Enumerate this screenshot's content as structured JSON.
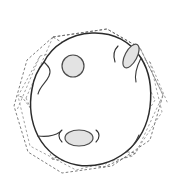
{
  "figure": {
    "background_color": "#ffffff",
    "width": 179,
    "height": 182
  },
  "style": {
    "cage_stroke": "#6e6e6e",
    "cage_dash": "2.6 2.1",
    "membrane_stroke": "#2b2b2b",
    "pore_fill": "#e3e3e3",
    "pore_stroke": "#4a4a4a"
  },
  "cage": {
    "name": "dodecahedral-wireframe",
    "line_style": "dashed",
    "top_face": "M 53 37 L 107 29 L 140 48 L 86 57 Z",
    "top_face_inner": "M 58 47 L 106 40 L 133 55 L 86 63 Z",
    "left_verticals": "M 53 37 L 26 98 M 58 47 L 33 101 M 40 56 L 17 110",
    "outer_hull": "M 53 37 L 107 29 L 140 48 L 163 95 L 150 140 L 112 166 L 62 173 L 28 152 L 14 106 L 27 60 Z",
    "second_hull": "M 40 56 L 99 41 L 150 62 L 162 112 L 133 156 L 76 170 L 30 146 L 18 96 Z",
    "bottom_face": "M 47 145 L 98 153 L 130 141 L 79 133 Z",
    "bottom_face_lower": "M 52 159 L 104 167 L 136 153 L 84 146 Z",
    "right_struts": "M 140 48 L 163 95 M 133 55 L 155 100 M 150 62 L 168 104",
    "bottom_struts": "M 26 98 L 47 145 M 33 101 L 52 159 M 163 95 L 136 153 M 155 100 L 130 141"
  },
  "facets": {
    "name": "interior-pentagon-edges",
    "paths": [
      "M 86 57 L 86 63 L 84 112 L 39 119 L 22 97",
      "M 84 112 L 121 140 L 136 112 L 133 55",
      "M 84 112 L 79 133",
      "M 121 140 L 104 167",
      "M 39 119 L 47 145",
      "M 133 55 L 140 48",
      "M 22 97 L 18 96"
    ]
  },
  "membrane": {
    "name": "vesicle-outline",
    "description": "irregular closed solid contour",
    "path": "M 44 62 C 52 46 70 34 92 33 C 114 32 131 42 141 58 C 150 72 152 90 150 107 C 148 124 140 141 126 152 C 112 163 94 168 77 165 C 60 162 46 151 38 136 C 31 122 29 105 32 89 C 34 77 38 69 44 62 Z",
    "crease_paths": [
      "M 44 62 C 48 66 52 69 49 76 C 46 83 40 86 38 94",
      "M 141 58 C 137 66 134 74 136 82",
      "M 126 152 C 132 148 136 142 139 135",
      "M 38 136 C 46 137 54 136 60 132"
    ]
  },
  "pores": [
    {
      "name": "pore-top-center",
      "shape": "circle",
      "cx": 73,
      "cy": 66,
      "rx": 11,
      "ry": 11,
      "rotation": 0,
      "fill": "#e3e3e3"
    },
    {
      "name": "pore-right-tilted",
      "shape": "ellipse",
      "cx": 131,
      "cy": 56,
      "rx": 13,
      "ry": 6,
      "rotation": -62,
      "fill": "#e3e3e3"
    },
    {
      "name": "pore-bottom-center",
      "shape": "ellipse",
      "cx": 79,
      "cy": 138,
      "rx": 14,
      "ry": 8,
      "rotation": 0,
      "fill": "#e3e3e3"
    }
  ],
  "pore_necks": [
    "M 62 142 C 58 138 58 133 62 130",
    "M 96 142 C 100 138 100 133 96 130",
    "M 118 46 C 114 50 113 56 115 62"
  ]
}
